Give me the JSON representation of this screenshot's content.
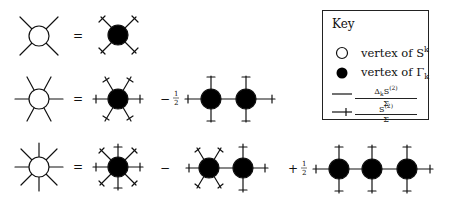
{
  "key": {
    "title": "Key",
    "items": [
      {
        "symbol": "open-circle",
        "label": "vertex of S",
        "sup": "k"
      },
      {
        "symbol": "filled-circle",
        "label": "vertex of Γ",
        "sub": "k"
      },
      {
        "symbol": "plain-line",
        "numerator": "Δ_k S^(2)",
        "denominator": "Σ"
      },
      {
        "symbol": "ticked-line",
        "numerator": "S^(2)",
        "denominator": "Σ"
      }
    ]
  },
  "equations": [
    {
      "row": 1,
      "lhs_legs": 4,
      "terms": [
        {
          "sign": "=",
          "coef": "",
          "vertices": 1
        }
      ]
    },
    {
      "row": 2,
      "lhs_legs": 6,
      "terms": [
        {
          "sign": "=",
          "coef": "",
          "vertices": 1
        },
        {
          "sign": "−",
          "coef": "1/2",
          "vertices": 2
        }
      ]
    },
    {
      "row": 3,
      "lhs_legs": 8,
      "terms": [
        {
          "sign": "=",
          "coef": "",
          "vertices": 1
        },
        {
          "sign": "−",
          "coef": "",
          "vertices": 2
        },
        {
          "sign": "+",
          "coef": "1/2",
          "vertices": 3
        }
      ]
    }
  ],
  "symbols": {
    "equals": "=",
    "minus": "−",
    "plus": "+",
    "half_num": "1",
    "half_den": "2"
  }
}
